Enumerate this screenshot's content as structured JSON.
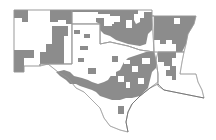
{
  "map": {
    "region": "South Central United States",
    "colors": {
      "shaded": "#8c8c8c",
      "unshaded": "#ffffff",
      "border": "#9a9a9a"
    },
    "states": [
      {
        "name": "New Mexico",
        "points": "14,10 72,10 72,64 40,64 40,66 24,66 24,72 14,72"
      },
      {
        "name": "Oklahoma",
        "points": "72,10 152,10 152,16 154,16 154,52 140,50 128,46 110,42 100,44 100,24 72,24"
      },
      {
        "name": "Arkansas",
        "points": "152,16 196,16 194,24 188,34 186,44 184,52 154,52"
      },
      {
        "name": "Texas",
        "points": "72,24 100,24 100,44 110,42 128,46 140,50 154,52 156,60 158,74 158,82 150,88 140,96 132,104 128,112 126,122 128,132 120,130 110,126 104,118 100,108 92,100 84,92 76,88 68,78 58,72 48,64 40,66 40,64 72,64"
      },
      {
        "name": "Louisiana",
        "points": "158,52 184,52 182,62 180,74 196,74 198,82 202,90 204,98 194,96 184,94 174,92 164,90 158,86 158,74 156,60"
      }
    ],
    "shaded_regions": [
      {
        "state": "New Mexico",
        "points": "14,10 28,10 28,22 22,22 22,18 14,18"
      },
      {
        "state": "New Mexico",
        "points": "50,10 72,10 72,24 66,24 66,20 58,20 58,22 50,22"
      },
      {
        "state": "New Mexico",
        "points": "52,26 68,26 68,36 64,36 64,64 40,64 40,52 46,52 46,44 52,44"
      },
      {
        "state": "New Mexico",
        "points": "14,50 34,50 34,58 24,58 24,72 14,72"
      },
      {
        "state": "Oklahoma",
        "points": "72,10 138,10 138,18 144,18 144,12 152,12 152,30 148,34 146,44 140,46 128,44 116,40 110,36 104,34 100,30 100,24 96,22 96,18 104,18 104,26 112,26 112,22 120,22 120,16 110,16 110,14 98,14 98,12 72,12"
      },
      {
        "state": "Arkansas",
        "points": "152,16 196,16 194,24 188,34 186,44 182,52 176,52 176,44 172,44 172,40 166,40 166,44 160,44 160,40 154,40 154,16"
      },
      {
        "state": "Texas",
        "points": "74,30 80,30 80,34 74,34"
      },
      {
        "state": "Texas",
        "points": "84,34 90,34 90,38 84,38"
      },
      {
        "state": "Texas",
        "points": "80,46 88,46 88,50 80,50"
      },
      {
        "state": "Texas",
        "points": "78,58 84,58 84,62 78,62"
      },
      {
        "state": "Texas",
        "points": "88,68 96,68 96,74 88,74"
      },
      {
        "state": "Texas",
        "points": "56,72 64,70 70,72 74,76 82,78 88,80 92,82 98,84 104,82 108,80 112,74 116,72 120,70 124,62 128,58 134,56 140,54 146,52 154,52 156,60 156,68 152,72 150,80 148,88 144,92 140,96 132,98 126,98 120,100 112,100 106,98 100,96 96,92 92,90 86,88 80,86 76,84 70,84 66,80 60,76"
      },
      {
        "state": "Texas",
        "points": "112,56 118,56 118,62 112,62"
      },
      {
        "state": "Texas",
        "points": "118,106 124,106 124,114 118,114"
      },
      {
        "state": "Louisiana",
        "points": "158,52 176,52 176,58 172,58 172,66 176,66 176,72 170,72 170,66 164,66 164,62 158,62"
      },
      {
        "state": "Louisiana",
        "points": "166,70 176,70 176,80 172,80 172,76 166,76"
      }
    ],
    "unshaded_holes": [
      {
        "points": "108,18 114,18 114,24 108,24"
      },
      {
        "points": "126,20 132,20 132,28 126,28"
      },
      {
        "points": "134,14 140,14 140,22 136,24 134,20"
      },
      {
        "points": "174,18 180,18 180,24 174,24"
      },
      {
        "points": "124,60 130,60 130,64 124,64"
      },
      {
        "points": "132,66 138,66 138,72 132,72"
      },
      {
        "points": "142,58 150,58 150,64 142,64"
      },
      {
        "points": "118,76 124,76 124,82 118,82"
      },
      {
        "points": "126,82 130,82 130,88 126,88"
      },
      {
        "points": "110,70 116,70 116,76 110,76"
      },
      {
        "points": "138,78 144,78 144,84 138,84"
      }
    ],
    "coastline": "128,132 126,122 128,112 132,104 140,96 150,88 158,84 164,90 174,92 184,94 194,96 204,98"
  }
}
